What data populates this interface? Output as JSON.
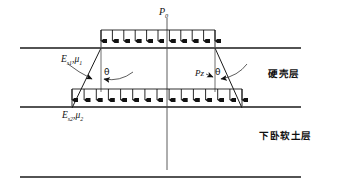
{
  "figure": {
    "labels": {
      "applied_load": "P",
      "applied_load_sub": "0",
      "upper_soil_modulus": "E",
      "upper_soil_modulus_sub": "s1",
      "upper_poisson": "μ",
      "upper_poisson_sub": "1",
      "lower_soil_modulus": "E",
      "lower_soil_modulus_sub": "s2",
      "lower_poisson": "μ",
      "lower_poisson_sub": "2",
      "transferred_pressure": "Pz",
      "spread_angle_left": "θ",
      "spread_angle_right": "θ",
      "hard_crust_layer": "硬壳层",
      "soft_soil_layer": "下卧软土层",
      "comma": ",",
      "comma2": ","
    },
    "geometry": {
      "ground_line_y": 48,
      "interface_line_y": 107,
      "bottom_line_y": 177,
      "centerline_x": 167,
      "top_load_left_x": 101,
      "top_load_right_x": 215,
      "bottom_load_left_x": 72,
      "bottom_load_right_x": 242,
      "top_arrow_count": 11,
      "bottom_arrow_count": 15
    },
    "colors": {
      "line": "#1a1a1a",
      "background": "#ffffff",
      "text": "#101010"
    }
  }
}
